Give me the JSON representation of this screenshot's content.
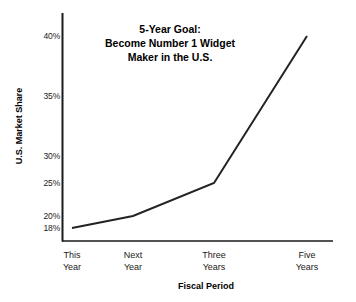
{
  "chart_data": {
    "type": "line",
    "title": "5-Year Goal: Become Number 1 Widget Maker in the U.S.",
    "title_lines": [
      "5-Year Goal:",
      "Become Number 1 Widget",
      "Maker in the U.S."
    ],
    "xlabel": "Fiscal Period",
    "ylabel": "U.S. Market Share",
    "categories": [
      "This Year",
      "Next Year",
      "Three Years",
      "Five Years"
    ],
    "category_lines": [
      [
        "This",
        "Year"
      ],
      [
        "Next",
        "Year"
      ],
      [
        "Three",
        "Years"
      ],
      [
        "Five",
        "Years"
      ]
    ],
    "values": [
      18,
      20,
      25,
      40
    ],
    "value_labels": [
      "18%",
      "20%",
      "25%",
      "40%"
    ],
    "ytick_labels": [
      "40%",
      "35%",
      "30%",
      "25%",
      "20%",
      "18%"
    ],
    "ytick_values": [
      40,
      35,
      30,
      25,
      20,
      18
    ],
    "ylim": [
      18,
      40
    ],
    "grid": false,
    "legend": "none",
    "series": [
      {
        "name": "U.S. Market Share",
        "values": [
          18,
          20,
          25,
          40
        ]
      }
    ],
    "line_color": "#232323",
    "axis_color": "#1a1a1a",
    "background_color": "#ffffff"
  },
  "geometry": {
    "ytick_y": [
      36,
      96,
      156,
      183,
      216,
      228
    ],
    "ytick_label_x": 50,
    "xtick_x": [
      72,
      133,
      214,
      307
    ],
    "xtick_label_y": 250,
    "point_x": [
      72,
      133,
      214,
      307
    ],
    "point_y": [
      230,
      216,
      183,
      36
    ],
    "axis_x": 62,
    "axis_y": 241,
    "axis_top": 13,
    "axis_right": 333
  }
}
